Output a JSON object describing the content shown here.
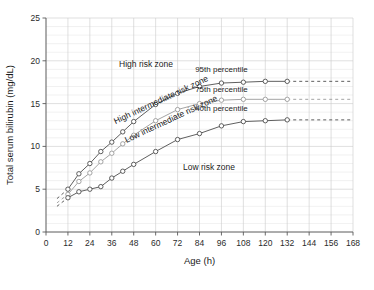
{
  "chart_data": {
    "type": "line",
    "title": "",
    "xlabel": "Age (h)",
    "ylabel": "Total serum bilirubin (mg/dL)",
    "xlim": [
      0,
      168
    ],
    "ylim": [
      0,
      25
    ],
    "xticks": [
      0,
      12,
      24,
      36,
      48,
      60,
      72,
      84,
      96,
      108,
      120,
      132,
      144,
      156,
      168
    ],
    "yticks": [
      0,
      5,
      10,
      15,
      20,
      25
    ],
    "xtick_labels": [
      "0",
      "12",
      "24",
      "36",
      "48",
      "60",
      "72",
      "84",
      "96",
      "108",
      "120",
      "132",
      "144",
      "156",
      "168"
    ],
    "ytick_labels": [
      "0",
      "5",
      "10",
      "15",
      "20",
      "25"
    ],
    "grid": true,
    "grid_minor_y_step": 1,
    "legend": "inline-annotations",
    "series": [
      {
        "name": "95th percentile",
        "color": "#4d4d4d",
        "x": [
          12,
          18,
          24,
          30,
          36,
          42,
          48,
          60,
          72,
          84,
          96,
          108,
          120,
          132
        ],
        "values": [
          5.0,
          6.8,
          8.0,
          9.4,
          10.5,
          11.7,
          12.9,
          14.9,
          16.2,
          17.0,
          17.4,
          17.5,
          17.6,
          17.6
        ],
        "lead_dashed_x": [
          6,
          12
        ],
        "lead_dashed_values": [
          3.9,
          5.0
        ],
        "trail_dashed_x": [
          132,
          168
        ],
        "trail_dashed_values": [
          17.6,
          17.6
        ],
        "marker": "circle"
      },
      {
        "name": "75th percentile",
        "color": "#9a9a9a",
        "x": [
          12,
          18,
          24,
          30,
          36,
          42,
          48,
          60,
          72,
          84,
          96,
          108,
          120,
          132
        ],
        "values": [
          4.4,
          5.9,
          6.9,
          8.2,
          9.2,
          10.3,
          11.3,
          13.0,
          14.3,
          15.0,
          15.4,
          15.5,
          15.5,
          15.5
        ],
        "lead_dashed_x": [
          6,
          12
        ],
        "lead_dashed_values": [
          3.4,
          4.4
        ],
        "trail_dashed_x": [
          132,
          168
        ],
        "trail_dashed_values": [
          15.5,
          15.5
        ],
        "marker": "circle"
      },
      {
        "name": "40th percentile",
        "color": "#4d4d4d",
        "x": [
          12,
          18,
          24,
          30,
          36,
          42,
          48,
          60,
          72,
          84,
          96,
          108,
          120,
          132
        ],
        "values": [
          4.0,
          4.7,
          5.0,
          5.3,
          6.3,
          7.1,
          7.9,
          9.4,
          10.8,
          11.5,
          12.4,
          12.9,
          13.0,
          13.1
        ],
        "lead_dashed_x": [
          6,
          12
        ],
        "lead_dashed_values": [
          3.0,
          4.0
        ],
        "trail_dashed_x": [
          132,
          168
        ],
        "trail_dashed_values": [
          13.1,
          13.1
        ],
        "marker": "circle"
      }
    ],
    "series_labels": [
      {
        "text": "95th percentile",
        "x": 96,
        "y": 18.7
      },
      {
        "text": "75th percentile",
        "x": 96,
        "y": 16.4
      },
      {
        "text": "40th percentile",
        "x": 96,
        "y": 14.1
      }
    ],
    "annotations": [
      {
        "text": "High risk zone",
        "x": 40,
        "y": 19.3,
        "rotation": 0
      },
      {
        "text": "High intermediate risk zone",
        "x": 38,
        "y": 12.6,
        "rotation": -25
      },
      {
        "text": "Low intermediate risk zone",
        "x": 44,
        "y": 10.4,
        "rotation": -25
      },
      {
        "text": "Low risk zone",
        "x": 75,
        "y": 7.2,
        "rotation": 0
      }
    ]
  },
  "colors": {
    "curve_dark": "#4d4d4d",
    "curve_light": "#9a9a9a",
    "grid_minor": "#e2e2e2",
    "grid_major": "#c9c9c9",
    "axis": "#5a5a5a",
    "background": "#ffffff"
  }
}
